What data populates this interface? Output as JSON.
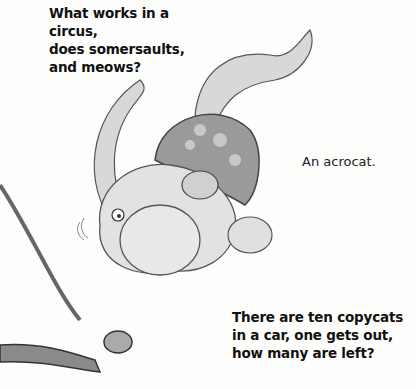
{
  "riddles": {
    "q1": {
      "lines": [
        "What works in a circus,",
        "does somersaults,",
        "and meows?"
      ]
    },
    "a1": "An acrocat.",
    "q2": {
      "lines": [
        "There are ten copycats",
        "in a car, one gets out,",
        "how many are left?"
      ]
    }
  },
  "illustration": {
    "subject": "cartoon cat acrobat somersaulting, wearing spotted cap",
    "prop": "trapeze bar and rope"
  }
}
